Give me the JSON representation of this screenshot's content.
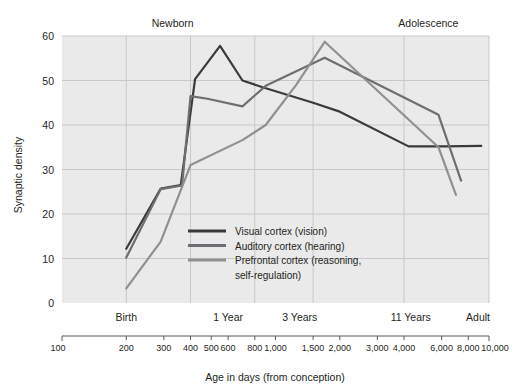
{
  "chart_data": {
    "type": "line",
    "title": "",
    "xlabel": "Age in days (from conception)",
    "ylabel": "Synaptic density",
    "xscale": "log",
    "xlim": [
      100,
      10000
    ],
    "ylim": [
      0,
      60
    ],
    "yticks": [
      0,
      10,
      20,
      30,
      40,
      50,
      60
    ],
    "xticks": [
      100,
      200,
      300,
      400,
      500,
      600,
      800,
      1000,
      1500,
      2000,
      3000,
      4000,
      6000,
      8000,
      10000
    ],
    "xtick_labels": [
      "100",
      "200",
      "300",
      "400",
      "500",
      "600",
      "800",
      "1,000",
      "1,500",
      "2,000",
      "3,000",
      "4,000",
      "6,000",
      "8,000",
      "10,000"
    ],
    "grid": true,
    "gridlines_x": [
      200,
      400,
      800,
      1500,
      4000,
      10000
    ],
    "stage_labels": [
      {
        "label": "Birth",
        "x": 200
      },
      {
        "label": "1 Year",
        "x": 600
      },
      {
        "label": "3 Years",
        "x": 1300
      },
      {
        "label": "11 Years",
        "x": 4300
      },
      {
        "label": "Adult",
        "x": 10000
      }
    ],
    "era_labels": [
      {
        "label": "Newborn",
        "x": 330
      },
      {
        "label": "Adolescence",
        "x": 5200
      }
    ],
    "legend_position": "center",
    "series": [
      {
        "name": "Visual cortex (vision)",
        "color": "#3a3a3c",
        "points": [
          {
            "x": 200,
            "y": 12.2
          },
          {
            "x": 290,
            "y": 25.7
          },
          {
            "x": 360,
            "y": 26.5
          },
          {
            "x": 420,
            "y": 50.3
          },
          {
            "x": 550,
            "y": 57.8
          },
          {
            "x": 700,
            "y": 50.0
          },
          {
            "x": 870,
            "y": 48.5
          },
          {
            "x": 1500,
            "y": 45.0
          },
          {
            "x": 2000,
            "y": 43.0
          },
          {
            "x": 4200,
            "y": 35.2
          },
          {
            "x": 6200,
            "y": 35.2
          },
          {
            "x": 9200,
            "y": 35.3
          }
        ]
      },
      {
        "name": "Auditory cortex (hearing)",
        "color": "#6d6e71",
        "points": [
          {
            "x": 200,
            "y": 10.2
          },
          {
            "x": 290,
            "y": 25.6
          },
          {
            "x": 365,
            "y": 26.4
          },
          {
            "x": 400,
            "y": 46.5
          },
          {
            "x": 480,
            "y": 45.9
          },
          {
            "x": 700,
            "y": 44.2
          },
          {
            "x": 900,
            "y": 48.8
          },
          {
            "x": 1700,
            "y": 55.1
          },
          {
            "x": 5800,
            "y": 42.3
          },
          {
            "x": 7400,
            "y": 27.5
          }
        ]
      },
      {
        "name": "Prefrontal cortex (reasoning, self-regulation)",
        "color": "#8f9091",
        "points": [
          {
            "x": 200,
            "y": 3.3
          },
          {
            "x": 290,
            "y": 13.8
          },
          {
            "x": 400,
            "y": 31.0
          },
          {
            "x": 700,
            "y": 36.6
          },
          {
            "x": 900,
            "y": 40.0
          },
          {
            "x": 1250,
            "y": 49.0
          },
          {
            "x": 1700,
            "y": 58.7
          },
          {
            "x": 5800,
            "y": 35.0
          },
          {
            "x": 7000,
            "y": 24.3
          }
        ]
      }
    ],
    "legend": [
      {
        "label": "Visual cortex (vision)",
        "color": "#3a3a3c"
      },
      {
        "label": "Auditory cortex (hearing)",
        "color": "#6d6e71"
      },
      {
        "label": "Prefrontal cortex (reasoning,",
        "label2": "self-regulation)",
        "color": "#8f9091"
      }
    ],
    "colors": {
      "plot_background": "#eaeaea",
      "grid": "#c8c8c8",
      "text": "#231f20",
      "axis": "#58595b"
    }
  }
}
